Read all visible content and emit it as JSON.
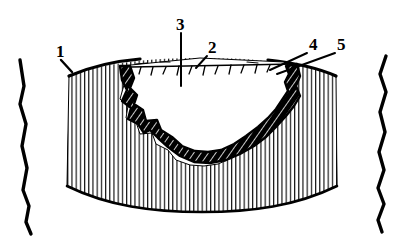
{
  "figure": {
    "type": "technical-cross-section-diagram",
    "title": "",
    "background_color": "#ffffff",
    "line_color": "#000000",
    "width": 404,
    "height": 246
  },
  "callouts": [
    {
      "id": "callout-1",
      "label": "1",
      "text_x": 56,
      "text_y": 57,
      "leader": "M 61 60 L 72 72",
      "points_to": "upper-left-outer-surface-of-hatched-body"
    },
    {
      "id": "callout-2",
      "label": "2",
      "text_x": 208,
      "text_y": 53,
      "leader": "M 207 56 L 196 68",
      "points_to": "ticked-surface-line-across-cavity-opening"
    },
    {
      "id": "callout-3",
      "label": "3",
      "text_x": 176,
      "text_y": 30,
      "leader": "M 181 33 L 181 86",
      "points_to": "cavity-interior-void"
    },
    {
      "id": "callout-4",
      "label": "4",
      "text_x": 309,
      "text_y": 50,
      "leader": "M 307 53 L 270 70",
      "points_to": "dark-band-right-arm-outer-edge"
    },
    {
      "id": "callout-5",
      "label": "5",
      "text_x": 337,
      "text_y": 50,
      "leader": "M 335 53 L 277 74",
      "points_to": "dark-band-right-arm-inner-edge"
    }
  ],
  "regions": [
    {
      "id": "hatched-body",
      "name": "vertically-hatched-body",
      "fill": "#ffffff",
      "hatch": "vertical",
      "hatch_spacing_px": 4.2,
      "hatch_color": "#000000"
    },
    {
      "id": "white-halo",
      "name": "white-transition-zone",
      "fill": "#ffffff",
      "hatch": "none"
    },
    {
      "id": "dark-band",
      "name": "dark-u-shaped-defect-band",
      "fill": "#000000",
      "hatch": "diagonal",
      "hatch_color": "#ffffff"
    },
    {
      "id": "cavity-void",
      "name": "cavity-void",
      "fill": "#ffffff",
      "hatch": "none"
    }
  ],
  "edges": [
    {
      "id": "left-fracture-line",
      "name": "left-irregular-fracture-edge"
    },
    {
      "id": "right-fracture-line",
      "name": "right-irregular-fracture-edge"
    },
    {
      "id": "surface-tick-line",
      "name": "ticked-surface-line",
      "tick_count": 11
    }
  ]
}
